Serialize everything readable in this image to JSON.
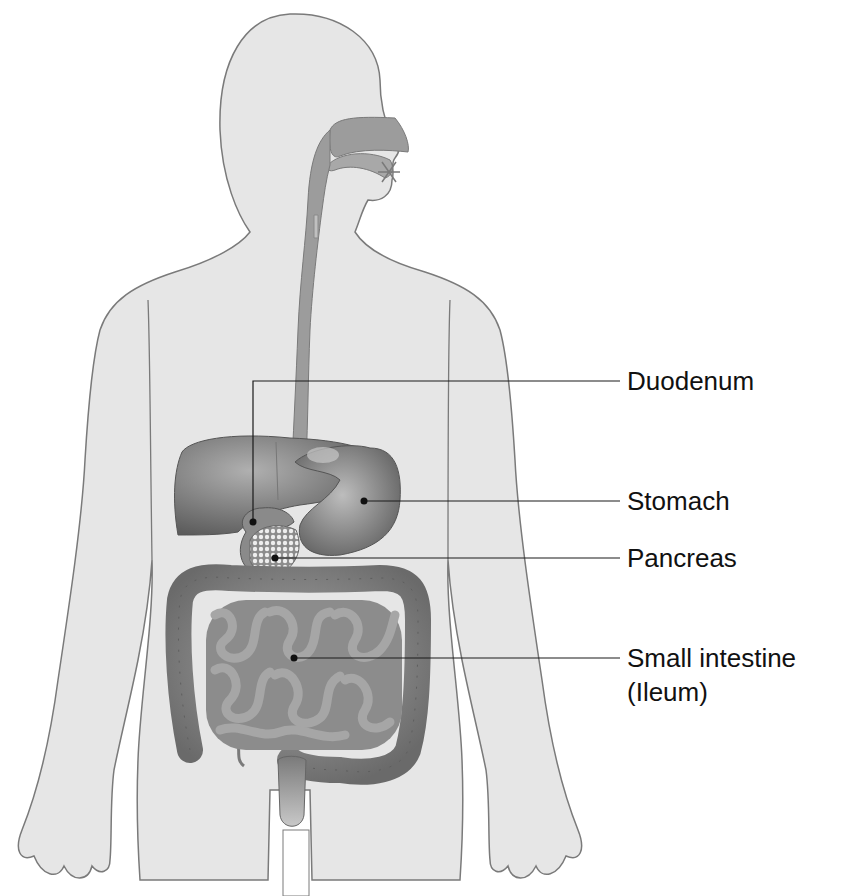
{
  "diagram": {
    "colors": {
      "body_fill": "#e6e6e6",
      "body_outline": "#7a7a7a",
      "organ_dark": "#6e6e6e",
      "organ_mid": "#9a9a9a",
      "organ_light": "#c4c4c4",
      "leader_line": "#1a1a1a",
      "label_text": "#111111"
    },
    "labels": [
      {
        "id": "duodenum",
        "text": "Duodenum",
        "x": 627,
        "y": 368
      },
      {
        "id": "stomach",
        "text": "Stomach",
        "x": 627,
        "y": 485
      },
      {
        "id": "pancreas",
        "text": "Pancreas",
        "x": 627,
        "y": 545
      },
      {
        "id": "small-intestine",
        "text": "Small intestine",
        "x": 627,
        "y": 642
      },
      {
        "id": "ileum",
        "text": "(Ileum)",
        "x": 627,
        "y": 676
      }
    ]
  }
}
